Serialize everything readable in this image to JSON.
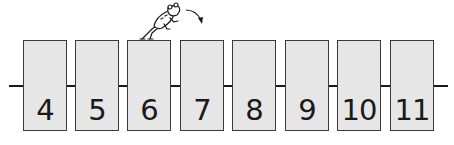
{
  "diagram": {
    "type": "number-line-cards",
    "cards": [
      {
        "value": "4",
        "left": 23
      },
      {
        "value": "5",
        "left": 75
      },
      {
        "value": "6",
        "left": 127
      },
      {
        "value": "7",
        "left": 180
      },
      {
        "value": "8",
        "left": 232
      },
      {
        "value": "9",
        "left": 285
      },
      {
        "value": "10",
        "left": 337
      },
      {
        "value": "11",
        "left": 390
      }
    ],
    "frog_position_card": "6",
    "jump_direction": "right",
    "colors": {
      "card_fill": "#e6e6e6",
      "card_border": "#3a3a3a",
      "line": "#1a1a1a",
      "text": "#1a1a1a"
    }
  }
}
